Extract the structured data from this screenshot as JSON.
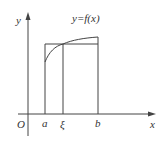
{
  "diagram": {
    "function_label": "y=f(x)",
    "axes": {
      "x_label": "x",
      "y_label": "y",
      "origin_label": "O"
    },
    "points": {
      "a": "a",
      "xi": "ξ",
      "b": "b"
    },
    "colors": {
      "line": "#444444",
      "text": "#333333",
      "background": "#ffffff"
    }
  }
}
